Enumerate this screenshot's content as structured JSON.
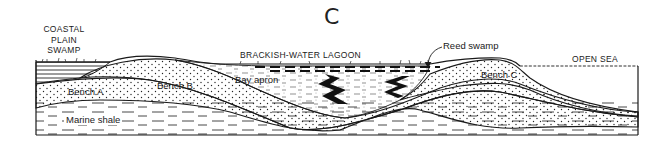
{
  "figure": {
    "panel_label": "C",
    "labels": {
      "coastal_plain_swamp": [
        "COASTAL",
        "PLAIN",
        "SWAMP"
      ],
      "brackish_water_lagoon": "BRACKISH-WATER LAGOON",
      "reed_swamp": "Reed swamp",
      "open_sea": "OPEN SEA",
      "bench_a": "Bench A",
      "bench_b": "Bench B",
      "bench_c": "Bench C",
      "bay_apron": "Bay apron",
      "marine_shale": "Marine shale"
    },
    "colors": {
      "ink": "#1a1a1a",
      "background": "#ffffff"
    }
  }
}
